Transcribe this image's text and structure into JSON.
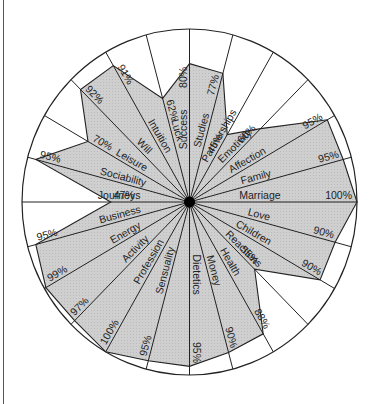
{
  "chart_data": {
    "type": "radar",
    "title": "",
    "scale_max": 100,
    "unit": "%",
    "start_direction": "up",
    "direction": "clockwise",
    "categories": [
      "Success",
      "Studies",
      "Partnerships",
      "Emotivity",
      "Affection",
      "Family",
      "Marriage",
      "Love",
      "Children",
      "Reactions",
      "Health",
      "Money",
      "Dietetics",
      "Sensuality",
      "Profession",
      "Activity",
      "Energy",
      "Business",
      "Journeys",
      "Sociability",
      "Leisure",
      "Will",
      "Intuition",
      "Luck"
    ],
    "values": [
      80,
      77,
      45,
      60,
      95,
      95,
      100,
      90,
      90,
      55,
      88,
      90,
      95,
      95,
      100,
      97,
      99,
      95,
      47,
      95,
      70,
      92,
      91,
      62
    ],
    "value_labels": [
      "80%",
      "77%",
      "45%",
      "60%",
      "95%",
      "95%",
      "100%",
      "90%",
      "90%",
      "55%",
      "88%",
      "90%",
      "95%",
      "95%",
      "100%",
      "97%",
      "99%",
      "95%",
      "47%",
      "95%",
      "70%",
      "92%",
      "91%",
      "62%"
    ],
    "fill_color": "#cfcfcf",
    "line_color": "#222222",
    "hub_color": "#000000"
  }
}
